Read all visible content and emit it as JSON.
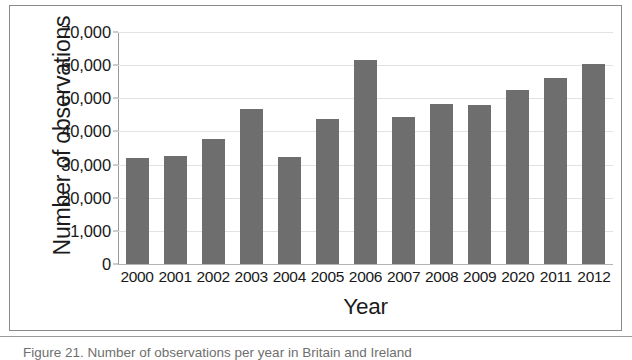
{
  "figure": {
    "caption": "Figure 21. Number of observations per year in Britain and Ireland"
  },
  "chart_data": {
    "type": "bar",
    "title": "",
    "xlabel": "Year",
    "ylabel": "Number of observations",
    "categories": [
      "2000",
      "2001",
      "2002",
      "2003",
      "2004",
      "2005",
      "2006",
      "2007",
      "2008",
      "2009",
      "2020",
      "2011",
      "2012"
    ],
    "values": [
      32000,
      32500,
      37700,
      46700,
      32200,
      43700,
      61600,
      44400,
      48300,
      48000,
      52500,
      56000,
      60500
    ],
    "ytick_labels": [
      "0",
      "1,000",
      "20,000",
      "30,000",
      "40,000",
      "50,000",
      "60,000",
      "70,000"
    ],
    "ytick_values": [
      0,
      10000,
      20000,
      30000,
      40000,
      50000,
      60000,
      70000
    ],
    "ylim": [
      0,
      70000
    ],
    "grid": true,
    "legend": "none",
    "bar_color": "#6e6e6e",
    "gridline_color": "#e2e2e2",
    "axis_color": "#9a9a9a",
    "note": "Y tick at 10,000 is mislabelled '1,000' and the 11th category is mislabelled '2020' in the source figure."
  }
}
